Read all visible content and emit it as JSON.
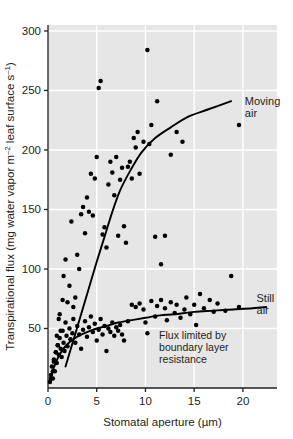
{
  "chart_data": {
    "type": "scatter",
    "title": "",
    "xlabel": "Stomatal aperture (µm)",
    "ylabel": "Transpirational flux (mg water vapor m⁻² leaf surface s⁻¹)",
    "ylabel_parts": {
      "pre": "Transpirational flux (mg water vapor m",
      "sup1": "–2",
      "mid": " leaf surface s",
      "sup2": "–1",
      "post": ")"
    },
    "xlim": [
      0,
      23.5
    ],
    "ylim": [
      0,
      305
    ],
    "xticks": [
      0,
      5,
      10,
      15,
      20
    ],
    "xtick_labels": [
      "0",
      "5",
      "10",
      "15",
      "20"
    ],
    "yticks": [
      50,
      100,
      150,
      200,
      250,
      300
    ],
    "ytick_labels": [
      "50",
      "100",
      "150",
      "200",
      "250",
      "300"
    ],
    "grid": true,
    "grid_color": "#ffffff",
    "plot_background": "#e6e6e6",
    "page_background": "#ffffff",
    "marker_color": "#000000",
    "curve_color": "#000000",
    "legend_position": "inline-annotations",
    "annotations": [
      {
        "name": "moving-air-label",
        "lines": [
          "Moving",
          "air"
        ],
        "x_data": 20.2,
        "y_data": 238
      },
      {
        "name": "still-air-label",
        "lines": [
          "Still",
          "air"
        ],
        "x_data": 21.4,
        "y_data": 72
      },
      {
        "name": "boundary-layer-note",
        "lines": [
          "Flux limited by",
          "boundary layer",
          "resistance"
        ],
        "x_data": 11.4,
        "y_data": 41
      }
    ],
    "series": [
      {
        "name": "Moving air",
        "label": "Moving air",
        "marker": "filled-circle",
        "curve": {
          "description": "steep near-linear rise through scatter, drawn from ~(1.8,18) to ~(18.8,240)",
          "points": [
            [
              1.8,
              18
            ],
            [
              2.6,
              40
            ],
            [
              3.4,
              62
            ],
            [
              4.2,
              84
            ],
            [
              5.0,
              106
            ],
            [
              5.8,
              127
            ],
            [
              6.6,
              148
            ],
            [
              7.4,
              166
            ],
            [
              8.4,
              182
            ],
            [
              9.6,
              198
            ],
            [
              11.0,
              210
            ],
            [
              12.6,
              219
            ],
            [
              14.4,
              228
            ],
            [
              16.4,
              234
            ],
            [
              18.8,
              241
            ]
          ]
        },
        "points": [
          [
            0.3,
            8
          ],
          [
            0.5,
            14
          ],
          [
            0.6,
            22
          ],
          [
            0.8,
            30
          ],
          [
            0.9,
            44
          ],
          [
            1.0,
            36
          ],
          [
            1.1,
            58
          ],
          [
            1.2,
            62
          ],
          [
            1.3,
            48
          ],
          [
            1.5,
            74
          ],
          [
            1.6,
            94
          ],
          [
            1.8,
            108
          ],
          [
            2.0,
            72
          ],
          [
            2.2,
            86
          ],
          [
            2.4,
            140
          ],
          [
            2.6,
            68
          ],
          [
            2.8,
            76
          ],
          [
            3.0,
            112
          ],
          [
            3.2,
            100
          ],
          [
            3.4,
            146
          ],
          [
            3.6,
            152
          ],
          [
            3.8,
            130
          ],
          [
            4.0,
            160
          ],
          [
            4.2,
            148
          ],
          [
            4.4,
            180
          ],
          [
            4.6,
            145
          ],
          [
            4.8,
            176
          ],
          [
            5.0,
            194
          ],
          [
            5.2,
            252
          ],
          [
            5.4,
            258
          ],
          [
            5.6,
            129
          ],
          [
            5.8,
            135
          ],
          [
            6.0,
            118
          ],
          [
            6.2,
            171
          ],
          [
            6.4,
            190
          ],
          [
            6.6,
            181
          ],
          [
            6.8,
            162
          ],
          [
            7.0,
            194
          ],
          [
            7.2,
            128
          ],
          [
            7.4,
            175
          ],
          [
            7.6,
            185
          ],
          [
            7.8,
            136
          ],
          [
            8.0,
            122
          ],
          [
            8.2,
            186
          ],
          [
            8.4,
            190
          ],
          [
            8.6,
            176
          ],
          [
            8.8,
            210
          ],
          [
            9.0,
            202
          ],
          [
            9.2,
            215
          ],
          [
            9.4,
            180
          ],
          [
            9.8,
            207
          ],
          [
            10.2,
            284
          ],
          [
            10.4,
            205
          ],
          [
            10.6,
            221
          ],
          [
            11.0,
            127
          ],
          [
            11.2,
            241
          ],
          [
            11.6,
            104
          ],
          [
            12.0,
            128
          ],
          [
            12.6,
            196
          ],
          [
            13.2,
            215
          ],
          [
            13.8,
            207
          ],
          [
            18.8,
            94
          ],
          [
            19.6,
            221
          ]
        ]
      },
      {
        "name": "Still air",
        "label": "Still air",
        "marker": "filled-circle",
        "curve": {
          "description": "saturating curve rising from origin to plateau near 68",
          "points": [
            [
              0.2,
              6
            ],
            [
              0.6,
              17
            ],
            [
              1.0,
              25
            ],
            [
              1.5,
              32
            ],
            [
              2.0,
              37
            ],
            [
              2.6,
              41
            ],
            [
              3.2,
              44
            ],
            [
              4.0,
              47
            ],
            [
              5.0,
              50
            ],
            [
              6.0,
              52
            ],
            [
              7.2,
              55
            ],
            [
              8.6,
              57
            ],
            [
              10.0,
              59
            ],
            [
              11.5,
              61
            ],
            [
              13.0,
              62
            ],
            [
              15.0,
              64
            ],
            [
              17.0,
              65
            ],
            [
              19.0,
              66
            ],
            [
              21.0,
              67
            ],
            [
              22.4,
              68
            ]
          ]
        },
        "points": [
          [
            0.2,
            5
          ],
          [
            0.3,
            11
          ],
          [
            0.4,
            18
          ],
          [
            0.5,
            8
          ],
          [
            0.6,
            24
          ],
          [
            0.7,
            14
          ],
          [
            0.8,
            30
          ],
          [
            0.9,
            21
          ],
          [
            1.0,
            36
          ],
          [
            1.1,
            28
          ],
          [
            1.2,
            42
          ],
          [
            1.3,
            33
          ],
          [
            1.4,
            26
          ],
          [
            1.5,
            48
          ],
          [
            1.6,
            38
          ],
          [
            1.7,
            31
          ],
          [
            1.8,
            55
          ],
          [
            1.9,
            44
          ],
          [
            2.0,
            35
          ],
          [
            2.2,
            50
          ],
          [
            2.3,
            41
          ],
          [
            2.5,
            46
          ],
          [
            2.6,
            58
          ],
          [
            2.8,
            38
          ],
          [
            3.0,
            52
          ],
          [
            3.2,
            45
          ],
          [
            3.4,
            33
          ],
          [
            3.6,
            49
          ],
          [
            3.8,
            56
          ],
          [
            4.0,
            43
          ],
          [
            4.2,
            51
          ],
          [
            4.4,
            60
          ],
          [
            4.6,
            47
          ],
          [
            4.8,
            54
          ],
          [
            5.0,
            40
          ],
          [
            5.2,
            49
          ],
          [
            5.4,
            58
          ],
          [
            5.6,
            45
          ],
          [
            5.8,
            52
          ],
          [
            6.0,
            31
          ],
          [
            6.2,
            50
          ],
          [
            6.4,
            47
          ],
          [
            6.6,
            55
          ],
          [
            6.8,
            44
          ],
          [
            7.0,
            51
          ],
          [
            7.2,
            48
          ],
          [
            7.4,
            53
          ],
          [
            7.6,
            45
          ],
          [
            7.8,
            40
          ],
          [
            8.2,
            56
          ],
          [
            8.6,
            70
          ],
          [
            9.0,
            68
          ],
          [
            9.4,
            71
          ],
          [
            9.8,
            66
          ],
          [
            10.0,
            55
          ],
          [
            10.2,
            46
          ],
          [
            10.6,
            73
          ],
          [
            11.0,
            60
          ],
          [
            11.2,
            69
          ],
          [
            11.6,
            74
          ],
          [
            12.0,
            67
          ],
          [
            12.2,
            57
          ],
          [
            12.6,
            72
          ],
          [
            13.0,
            63
          ],
          [
            13.2,
            70
          ],
          [
            13.6,
            59
          ],
          [
            14.0,
            66
          ],
          [
            14.2,
            76
          ],
          [
            14.6,
            62
          ],
          [
            15.0,
            70
          ],
          [
            15.2,
            53
          ],
          [
            15.6,
            79
          ],
          [
            16.0,
            67
          ],
          [
            16.6,
            74
          ],
          [
            17.0,
            64
          ],
          [
            17.4,
            71
          ],
          [
            18.2,
            65
          ],
          [
            19.6,
            68
          ]
        ]
      }
    ]
  }
}
